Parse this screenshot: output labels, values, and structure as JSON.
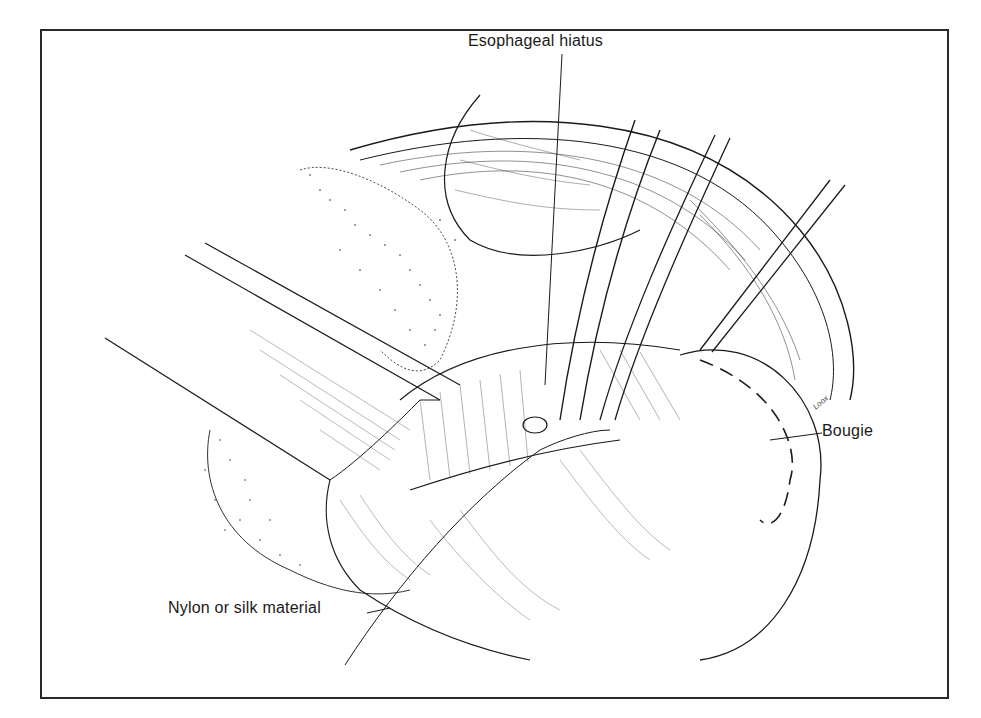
{
  "figure": {
    "type": "surgical-illustration",
    "labels": {
      "esophageal_hiatus": "Esophageal hiatus",
      "bougie": "Bougie",
      "suture_material": "Nylon or silk material"
    },
    "signature": "Loox",
    "colors": {
      "ink": "#1a1a1a",
      "background": "#ffffff",
      "border": "#2a2a2a"
    }
  }
}
